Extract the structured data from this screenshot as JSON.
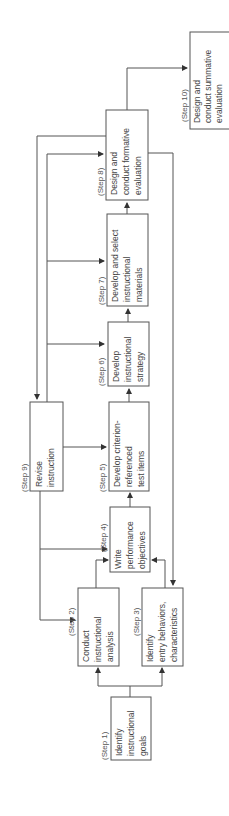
{
  "diagram": {
    "orientation": "rotated-90-ccw",
    "steps": [
      {
        "label": "(Step  1)",
        "lines": [
          "Identify",
          "instructional",
          "goals"
        ]
      },
      {
        "label": "(Step  2)",
        "lines": [
          "Conduct",
          "instructional",
          "analysis"
        ]
      },
      {
        "label": "(Step  3)",
        "lines": [
          "Identify",
          "entry behaviors,",
          "characteristics"
        ]
      },
      {
        "label": "(Step  4)",
        "lines": [
          "Write",
          "performance",
          "objectives"
        ]
      },
      {
        "label": "(Step  5)",
        "lines": [
          "Develop criterion-",
          "referenced",
          "test items"
        ]
      },
      {
        "label": "(Step  6)",
        "lines": [
          "Develop",
          "instructional",
          "strategy"
        ]
      },
      {
        "label": "(Step  7)",
        "lines": [
          "Develop and select",
          "instructional",
          "materials"
        ]
      },
      {
        "label": "(Step  8)",
        "lines": [
          "Design and",
          "conduct formative",
          "evaluation"
        ]
      },
      {
        "label": "(Step  9)",
        "lines": [
          "Revise",
          "instruction"
        ]
      },
      {
        "label": "(Step  10)",
        "lines": [
          "Design and",
          "conduct summative",
          "evaluation"
        ]
      }
    ],
    "edges": [
      [
        "Step 1",
        "Step 2"
      ],
      [
        "Step 1",
        "Step 3"
      ],
      [
        "Step 2",
        "Step 4"
      ],
      [
        "Step 3",
        "Step 4"
      ],
      [
        "Step 4",
        "Step 5"
      ],
      [
        "Step 5",
        "Step 6"
      ],
      [
        "Step 6",
        "Step 7"
      ],
      [
        "Step 7",
        "Step 8"
      ],
      [
        "Step 8",
        "Step 9"
      ],
      [
        "Step 8",
        "Step 10"
      ],
      [
        "Step 8",
        "Step 3"
      ],
      [
        "Step 9",
        "Step 2"
      ],
      [
        "Step 9",
        "Step 4"
      ],
      [
        "Step 9",
        "Step 5"
      ],
      [
        "Step 9",
        "Step 6"
      ],
      [
        "Step 9",
        "Step 7"
      ],
      [
        "Step 9",
        "Step 8"
      ]
    ]
  }
}
